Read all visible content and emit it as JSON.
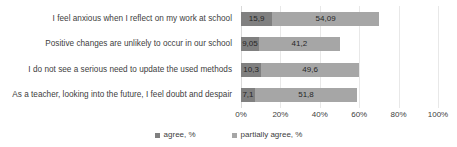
{
  "chart_data": {
    "type": "bar",
    "orientation": "horizontal",
    "stacked": true,
    "title": "",
    "xlabel": "",
    "ylabel": "",
    "xlim": [
      0,
      100
    ],
    "grid": true,
    "legend_position": "bottom",
    "xticks": [
      "0%",
      "20%",
      "40%",
      "60%",
      "80%",
      "100%"
    ],
    "xtick_values": [
      0,
      20,
      40,
      60,
      80,
      100
    ],
    "categories": [
      "I feel anxious when I reflect on my work at school",
      "Positive changes are unlikely to occur in our school",
      "I do not see a serious need to update the used methods",
      "As a teacher, looking into the future, I feel doubt and despair"
    ],
    "series": [
      {
        "name": "agree, %",
        "color": "#808080",
        "values": [
          15.9,
          9.05,
          10.3,
          7.1
        ],
        "labels": [
          "15,9",
          "9,05",
          "10,3",
          "7,1"
        ]
      },
      {
        "name": "partially agree, %",
        "color": "#a6a6a6",
        "values": [
          54.09,
          41.2,
          49.6,
          51.8
        ],
        "labels": [
          "54,09",
          "41,2",
          "49,6",
          "51,8"
        ]
      }
    ]
  },
  "legend": {
    "items": [
      {
        "label": "agree, %",
        "color": "#808080"
      },
      {
        "label": "partially agree, %",
        "color": "#a6a6a6"
      }
    ]
  }
}
